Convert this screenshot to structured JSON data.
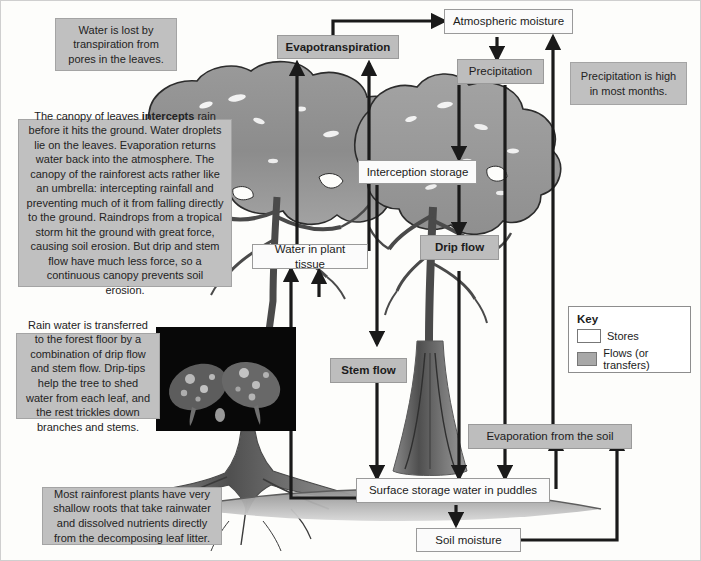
{
  "diagram": {
    "colors": {
      "store_fill": "#fbfbfb",
      "flow_fill": "#bdbdbd",
      "note_fill": "#c0c0c0",
      "arrow": "#1a1a1a",
      "canopy": "#8e8e8e",
      "trunk": "#6b6b6b",
      "ground": "#b9b9b9"
    },
    "boxes": [
      {
        "id": "evapotranspiration",
        "label": "Evapotranspiration",
        "type": "flow"
      },
      {
        "id": "atmospheric-moisture",
        "label": "Atmospheric moisture",
        "type": "store"
      },
      {
        "id": "precipitation",
        "label": "Precipitation",
        "type": "flow-plain"
      },
      {
        "id": "interception-storage",
        "label": "Interception storage",
        "type": "store"
      },
      {
        "id": "water-in-plant-tissue",
        "label": "Water in plant tissue",
        "type": "store"
      },
      {
        "id": "drip-flow",
        "label": "Drip flow",
        "type": "flow"
      },
      {
        "id": "stem-flow",
        "label": "Stem flow",
        "type": "flow"
      },
      {
        "id": "evaporation-from-the-soil",
        "label": "Evaporation from the soil",
        "type": "flow-plain"
      },
      {
        "id": "surface-storage",
        "label": "Surface storage water in puddles",
        "type": "store"
      },
      {
        "id": "soil-moisture",
        "label": "Soil moisture",
        "type": "store"
      }
    ],
    "notes": {
      "transpiration": "Water is lost by transpiration from pores in the leaves.",
      "canopy_pre": "The canopy of leaves ",
      "canopy_bold": "intercepts",
      "canopy_post": " rain before it hits the ground. Water droplets lie on the leaves. Evaporation returns water back into the atmosphere. The canopy of the rainforest acts rather like an umbrella: intercepting rainfall and preventing much of it from falling directly to the ground. Raindrops from a tropical storm hit the ground with great force, causing soil erosion. But drip and stem flow have much less force, so a continuous canopy prevents soil erosion.",
      "rainwater_transfer": "Rain water is transferred to the forest floor by a combination of drip flow and stem flow. Drip-tips help the tree to shed water from each leaf, and the rest trickles down branches and stems.",
      "precipitation_high": "Precipitation is high in most months.",
      "shallow_roots": "Most rainforest plants have very shallow roots that take rainwater and dissolved nutrients directly from the decomposing leaf litter."
    },
    "key": {
      "title": "Key",
      "stores_label": "Stores",
      "flows_label": "Flows (or transfers)"
    },
    "photo_caption": "Leaves with water droplets and drip-tips"
  }
}
